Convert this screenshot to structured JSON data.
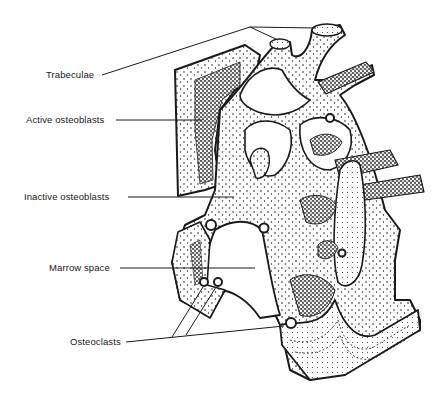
{
  "figure": {
    "style": "black-and-white stippled line drawing",
    "colors": {
      "background": "#ffffff",
      "ink": "#1a1a1a"
    }
  },
  "labels": [
    {
      "id": "trabeculae",
      "text": "Trabeculae",
      "x": 46,
      "y": 69
    },
    {
      "id": "active-osteoblasts",
      "text": "Active osteoblasts",
      "x": 26,
      "y": 114
    },
    {
      "id": "inactive-osteoblasts",
      "text": "Inactive osteoblasts",
      "x": 24,
      "y": 191
    },
    {
      "id": "marrow-space",
      "text": "Marrow space",
      "x": 49,
      "y": 262
    },
    {
      "id": "osteoclasts",
      "text": "Osteoclasts",
      "x": 70,
      "y": 336
    }
  ]
}
